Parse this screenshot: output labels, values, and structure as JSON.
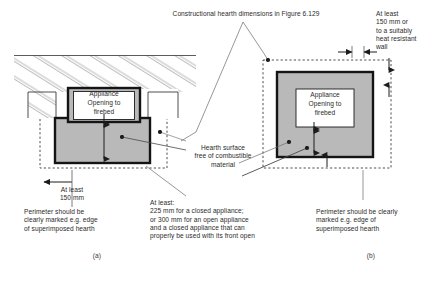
{
  "figure": {
    "title_note": "Constructional hearth dimensions in Figure 6.129",
    "colors": {
      "hearth_fill": "#b9b9b9",
      "hearth_border": "#1a1a1a",
      "line": "#333333",
      "text": "#2b2b2b",
      "appliance_box_fill": "#ffffff",
      "dashed_perimeter": "#3a3a3a"
    },
    "panels": [
      {
        "id": "a",
        "caption": "(a)",
        "appliance_label": "Appliance\nOpening to\nfirebed",
        "notes": [
          "At least\n150 mm",
          "Perimeter should be\nclearly marked e.g. edge\nof superimposed hearth"
        ]
      },
      {
        "id": "b",
        "caption": "(b)",
        "appliance_label": "Appliance\nOpening to\nfirebed",
        "notes": [
          "At least\n150 mm or\nto a suitably\nheat resistant\nwall",
          "Perimeter should be clearly\nmarked e.g. edge of\nsuperimposed hearth"
        ]
      }
    ],
    "callouts": {
      "hearth_surface": "Hearth surface\nfree of combustible\nmaterial",
      "at_least_block": "At least:\n225 mm for a closed appliance;\nor 300 mm for an open appliance\nand a closed appliance that can\nproperly be used with its front open",
      "perimeter_left": "Perimeter should be\nclearly marked e.g. edge\nof superimposed hearth",
      "perimeter_right": "Perimeter should be clearly\nmarked e.g. edge of\nsuperimposed hearth",
      "at_least_150": "At least\n150 mm",
      "at_least_150_wall": "At least\n150 mm or\nto a suitably\nheat resistant\nwall"
    }
  }
}
